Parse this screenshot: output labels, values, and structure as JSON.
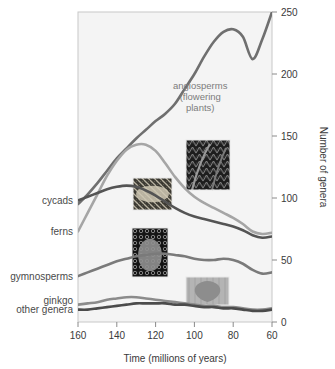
{
  "chart_data": {
    "type": "line",
    "title": "",
    "xlabel": "Time (millions of years)",
    "ylabel": "Number of genera",
    "xlim": [
      160,
      60
    ],
    "ylim": [
      0,
      250
    ],
    "x_ticks": [
      160,
      140,
      120,
      100,
      80,
      60
    ],
    "y_ticks": [
      0,
      50,
      100,
      150,
      200,
      250
    ],
    "x_reversed": true,
    "grid": false,
    "legend_position": "inline-left-labels",
    "x": [
      160,
      155,
      150,
      145,
      140,
      135,
      130,
      125,
      120,
      115,
      110,
      105,
      100,
      95,
      90,
      85,
      80,
      75,
      70,
      65,
      60
    ],
    "series": [
      {
        "name": "angiosperms (flowering plants)",
        "color": "#6f6f6f",
        "label_position": "inline-annotation",
        "values": [
          95,
          103,
          112,
          122,
          132,
          140,
          148,
          155,
          162,
          168,
          176,
          188,
          200,
          214,
          226,
          234,
          236,
          230,
          212,
          228,
          250
        ]
      },
      {
        "name": "ferns",
        "color": "#a5a5a5",
        "label_position": "left-axis",
        "values": [
          73,
          88,
          103,
          118,
          130,
          139,
          143,
          143,
          138,
          128,
          117,
          108,
          101,
          96,
          92,
          88,
          84,
          79,
          73,
          71,
          72
        ]
      },
      {
        "name": "cycads",
        "color": "#545454",
        "label_position": "left-axis",
        "values": [
          98,
          101,
          104,
          107,
          109,
          110,
          109,
          106,
          102,
          97,
          92,
          88,
          85,
          83,
          81,
          79,
          77,
          74,
          70,
          68,
          69
        ]
      },
      {
        "name": "gymnosperms",
        "color": "#7a7a7a",
        "label_position": "left-axis",
        "values": [
          37,
          40,
          43,
          46,
          49,
          51,
          53,
          54,
          55,
          55,
          54,
          53,
          51,
          50,
          50,
          51,
          50,
          47,
          42,
          39,
          40
        ]
      },
      {
        "name": "ginkgo",
        "color": "#8b8b8b",
        "label_position": "left-axis",
        "values": [
          14,
          15,
          16,
          18,
          19,
          20,
          20,
          19,
          18,
          17,
          16,
          15,
          14,
          13,
          13,
          12,
          12,
          11,
          10,
          10,
          11
        ]
      },
      {
        "name": "other genera",
        "color": "#4b4b4b",
        "label_position": "left-axis",
        "values": [
          10,
          10,
          11,
          12,
          13,
          14,
          15,
          15,
          15,
          15,
          14,
          14,
          13,
          12,
          12,
          11,
          11,
          10,
          9,
          9,
          10
        ]
      }
    ],
    "annotations": [
      {
        "name": "angiosperms",
        "lines": [
          "angiosperms",
          "(flowering",
          "plants)"
        ],
        "x": 97,
        "y": 188
      }
    ],
    "left_labels": [
      {
        "text": "cycads",
        "y_value": 98
      },
      {
        "text": "ferns",
        "y_value": 73
      },
      {
        "text": "gymnosperms",
        "y_value": 37
      },
      {
        "text": "ginkgo",
        "y_value": 17
      },
      {
        "text": "other genera",
        "y_value": 10
      }
    ],
    "photos": [
      {
        "name": "fern-photo",
        "subject": "fern fronds",
        "x": 186,
        "y": 140,
        "w": 44,
        "h": 50,
        "tone": "dark"
      },
      {
        "name": "cycad-photo",
        "subject": "cycad frond",
        "x": 133,
        "y": 178,
        "w": 39,
        "h": 32,
        "tone": "mid"
      },
      {
        "name": "conifer-cone-photo",
        "subject": "pine cone",
        "x": 132,
        "y": 228,
        "w": 36,
        "h": 49,
        "tone": "dark"
      },
      {
        "name": "ginkgo-leaf-photo",
        "subject": "ginkgo leaf",
        "x": 186,
        "y": 277,
        "w": 43,
        "h": 28,
        "tone": "light"
      }
    ]
  },
  "plot_frame": {
    "left": 78,
    "top": 12,
    "right": 272,
    "bottom": 322,
    "background": "#f4f4f4",
    "border_color": "#c8c8c8"
  }
}
